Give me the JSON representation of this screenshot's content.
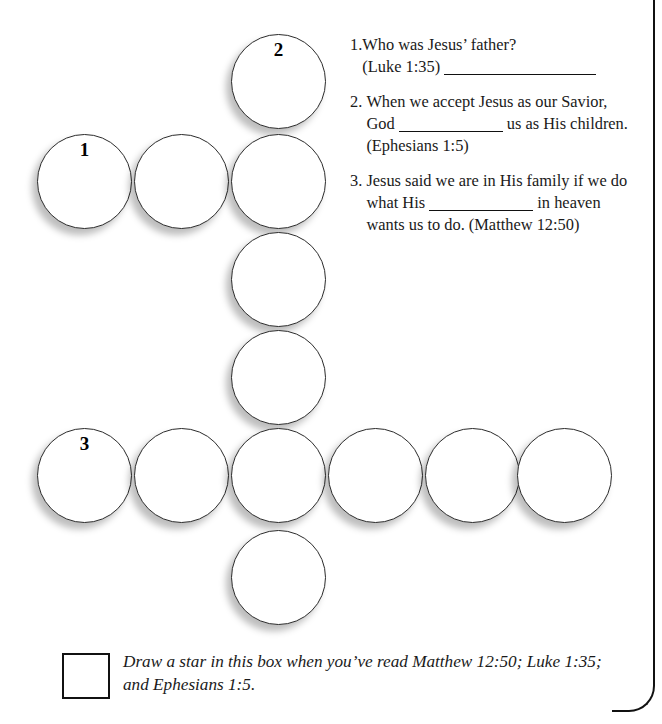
{
  "page": {
    "background_color": "#ffffff",
    "ink_color": "#1a1a1a",
    "border_color": "#111111"
  },
  "puzzle": {
    "circle_diameter": 95,
    "circles": [
      {
        "id": "c-top",
        "x": 231,
        "y": 34,
        "label": "2",
        "label_position": "inside"
      },
      {
        "id": "c-r2-a",
        "x": 37,
        "y": 134,
        "label": "1",
        "label_position": "inside"
      },
      {
        "id": "c-r2-b",
        "x": 134,
        "y": 134,
        "label": "",
        "label_position": "inside"
      },
      {
        "id": "c-r2-c",
        "x": 231,
        "y": 134,
        "label": "",
        "label_position": "inside"
      },
      {
        "id": "c-r3",
        "x": 231,
        "y": 232,
        "label": "",
        "label_position": "inside"
      },
      {
        "id": "c-r4",
        "x": 231,
        "y": 330,
        "label": "",
        "label_position": "inside"
      },
      {
        "id": "c-r5-a",
        "x": 37,
        "y": 428,
        "label": "3",
        "label_position": "inside"
      },
      {
        "id": "c-r5-b",
        "x": 134,
        "y": 428,
        "label": "",
        "label_position": "inside"
      },
      {
        "id": "c-r5-c",
        "x": 231,
        "y": 428,
        "label": "",
        "label_position": "inside"
      },
      {
        "id": "c-r5-d",
        "x": 328,
        "y": 428,
        "label": "",
        "label_position": "inside"
      },
      {
        "id": "c-r5-e",
        "x": 425,
        "y": 428,
        "label": "",
        "label_position": "inside"
      },
      {
        "id": "c-r5-f",
        "x": 517,
        "y": 428,
        "label": "",
        "label_position": "inside"
      },
      {
        "id": "c-bottom",
        "x": 231,
        "y": 530,
        "label": "",
        "label_position": "inside"
      }
    ]
  },
  "questions": [
    {
      "marker": "1.",
      "segments": [
        {
          "type": "text",
          "value": "Who was Jesus’ father?"
        },
        {
          "type": "break"
        },
        {
          "type": "text",
          "value": "(Luke 1:35) "
        },
        {
          "type": "blank",
          "size": "long"
        }
      ],
      "plain_text": "1.Who was Jesus’ father? (Luke 1:35) ____________________"
    },
    {
      "marker": "2. ",
      "segments": [
        {
          "type": "text",
          "value": "When we accept Jesus as our Savior, God "
        },
        {
          "type": "blank",
          "size": "medium"
        },
        {
          "type": "text",
          "value": " us as His children. (Ephesians 1:5)"
        }
      ],
      "plain_text": "2. When we accept Jesus as our Savior, God __________ us as His children. (Ephesians 1:5)"
    },
    {
      "marker": "3. ",
      "segments": [
        {
          "type": "text",
          "value": "Jesus said we are in His family if we do what His "
        },
        {
          "type": "blank",
          "size": "medium"
        },
        {
          "type": "text",
          "value": " in heaven wants us to do. (Matthew 12:50)"
        }
      ],
      "plain_text": "3. Jesus said we are in His family if we do what His __________ in heaven wants us to do. (Matthew 12:50)"
    }
  ],
  "footer": {
    "checkbox_label": "star-box",
    "text": "Draw a star in this box when you’ve read Matthew 12:50; Luke 1:35; and Ephesians 1:5."
  }
}
